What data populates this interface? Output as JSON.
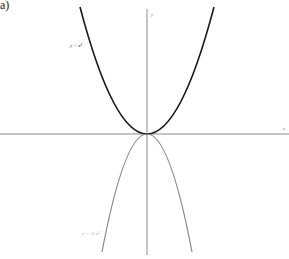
{
  "panel_label": "a)",
  "axes": {
    "x_label": "x",
    "y_label": "y"
  },
  "curves": [
    {
      "name": "y = x^2",
      "label": "y = x²",
      "color": "#1a1a1a"
    },
    {
      "name": "y = -2x^2",
      "label": "y = -2 x²",
      "color": "#8a8a8a"
    }
  ],
  "colors": {
    "axis": "#888888",
    "background": "#ffffff"
  }
}
